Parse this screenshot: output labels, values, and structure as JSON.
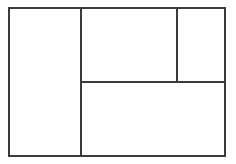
{
  "diagram": {
    "background_color": "#ffffff",
    "line_color": "#3b3b3b",
    "line_width_px": 2,
    "canvas": {
      "width": 236,
      "height": 164
    },
    "outer_rect": {
      "x": 8,
      "y": 7,
      "width": 218,
      "height": 150,
      "label": ""
    },
    "dividers": [
      {
        "name": "vertical-left",
        "orientation": "vertical",
        "x": 80,
        "y": 7,
        "length": 150,
        "label": ""
      },
      {
        "name": "horizontal-middle",
        "orientation": "horizontal",
        "x": 80,
        "y": 81,
        "length": 146,
        "label": ""
      },
      {
        "name": "vertical-right",
        "orientation": "vertical",
        "x": 176,
        "y": 7,
        "length": 76,
        "label": ""
      }
    ],
    "panes": [
      {
        "name": "left-column",
        "x": 8,
        "y": 7,
        "width": 74,
        "height": 150,
        "label": "",
        "content": ""
      },
      {
        "name": "top-middle",
        "x": 80,
        "y": 7,
        "width": 98,
        "height": 76,
        "label": "",
        "content": ""
      },
      {
        "name": "top-right",
        "x": 176,
        "y": 7,
        "width": 50,
        "height": 76,
        "label": "",
        "content": ""
      },
      {
        "name": "bottom-right",
        "x": 80,
        "y": 81,
        "width": 146,
        "height": 76,
        "label": "",
        "content": ""
      }
    ],
    "pane_count": 4
  }
}
